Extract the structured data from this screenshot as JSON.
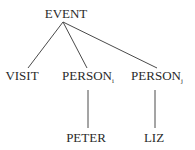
{
  "diagram": {
    "type": "tree",
    "nodes": {
      "root": {
        "label": "EVENT",
        "subscript": ""
      },
      "visit": {
        "label": "VISIT",
        "subscript": ""
      },
      "person_i": {
        "label": "PERSON",
        "subscript": "i"
      },
      "person_j": {
        "label": "PERSON",
        "subscript": "j"
      },
      "peter": {
        "label": "PETER",
        "subscript": ""
      },
      "liz": {
        "label": "LIZ",
        "subscript": ""
      }
    },
    "edges": [
      [
        "root",
        "visit"
      ],
      [
        "root",
        "person_i"
      ],
      [
        "root",
        "person_j"
      ],
      [
        "person_i",
        "peter"
      ],
      [
        "person_j",
        "liz"
      ]
    ],
    "line_color": "#4a4a4a",
    "text_color": "#2a2a2a"
  }
}
